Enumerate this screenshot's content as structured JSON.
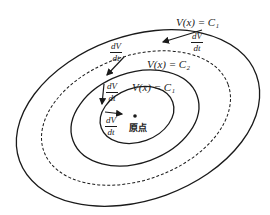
{
  "diagram": {
    "type": "lyapunov-level-sets",
    "level_sets": [
      {
        "id": "inner",
        "label": "V(x) = C₁",
        "style": "solid"
      },
      {
        "id": "middle",
        "label": "V(x) = C₂",
        "style": "solid"
      },
      {
        "id": "dashed",
        "label": "",
        "style": "dashed"
      },
      {
        "id": "outer",
        "label": "V(x) = C₁",
        "style": "solid"
      }
    ],
    "derivative_labels": [
      {
        "num": "dV",
        "den": "dt"
      },
      {
        "num": "dV",
        "den": "dt"
      },
      {
        "num": "dV",
        "den": "dt"
      },
      {
        "num": "dV",
        "den": "dt"
      }
    ],
    "origin_label": "原点",
    "colors": {
      "stroke": "#1a1a1a",
      "background": "#ffffff"
    }
  }
}
